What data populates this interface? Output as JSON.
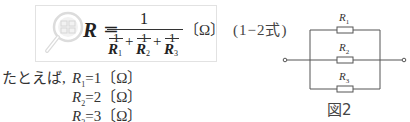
{
  "formula": {
    "icon": "magnifier-formula-icon",
    "lhs": "R",
    "equals": "=",
    "numerator": "1",
    "terms": [
      {
        "num": "1",
        "den": "R",
        "sub": "1"
      },
      {
        "num": "1",
        "den": "R",
        "sub": "2"
      },
      {
        "num": "1",
        "den": "R",
        "sub": "3"
      }
    ],
    "plus": "+",
    "unit": "〔Ω〕",
    "equation_number": "(1−2式)"
  },
  "example": {
    "intro": "たとえば,",
    "lines": [
      {
        "var": "R",
        "sub": "1",
        "text": "=1〔Ω〕"
      },
      {
        "var": "R",
        "sub": "2",
        "text": "=2〔Ω〕"
      },
      {
        "var": "R",
        "sub": "3",
        "text": "=3〔Ω〕"
      }
    ]
  },
  "figure": {
    "caption": "図2",
    "resistors": [
      {
        "label": "R",
        "sub": "1"
      },
      {
        "label": "R",
        "sub": "2"
      },
      {
        "label": "R",
        "sub": "3"
      }
    ],
    "line_color": "#555555"
  }
}
